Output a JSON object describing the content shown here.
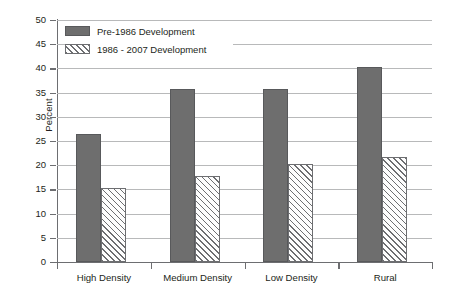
{
  "chart_data": {
    "type": "bar",
    "title": "",
    "subtitle": "",
    "xlabel": "",
    "ylabel": "Percent",
    "ylim": [
      0,
      50
    ],
    "ytick_step": 5,
    "yticks": [
      0,
      5,
      10,
      15,
      20,
      25,
      30,
      35,
      40,
      45,
      50
    ],
    "grid": true,
    "grid_axis": "y",
    "legend_position": "upper-left-inside",
    "categories": [
      "High Density",
      "Medium Density",
      "Low Density",
      "Rural"
    ],
    "series": [
      {
        "name": "Pre-1986 Development",
        "color": "#6e6e6e",
        "fill": "solid",
        "values": [
          26.5,
          35.8,
          35.8,
          40.2
        ]
      },
      {
        "name": "1986 - 2007 Development",
        "color": "#ffffff",
        "fill": "diagonal-hatch",
        "values": [
          15.3,
          17.7,
          20.3,
          21.8
        ]
      }
    ],
    "annotations": []
  },
  "axes": {
    "y_title": "Percent",
    "y_tick_labels": [
      "50",
      "45",
      "40",
      "35",
      "30",
      "25",
      "20",
      "15",
      "10",
      "5",
      "0"
    ],
    "x_tick_labels": [
      "High Density",
      "Medium Density",
      "Low Density",
      "Rural"
    ]
  },
  "legend": {
    "entries": [
      {
        "label": "Pre-1986 Development",
        "swatch": "solid-gray-swatch"
      },
      {
        "label": "1986 - 2007 Development",
        "swatch": "hatched-swatch"
      }
    ]
  },
  "colors": {
    "bar_solid": "#6e6e6e",
    "bar_solid_border": "#58595b",
    "hatch_line": "#6d6e71",
    "gridline": "#b8b9ba",
    "axis": "#6d6e71",
    "text": "#231f20",
    "background": "#ffffff"
  }
}
